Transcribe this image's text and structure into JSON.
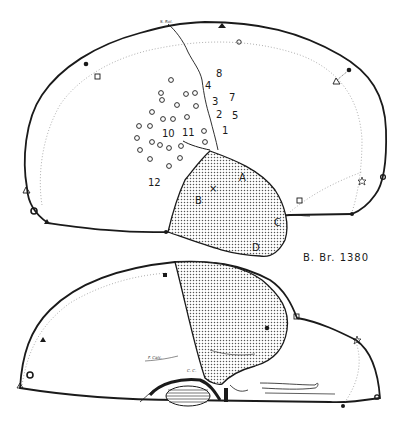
{
  "figure": {
    "specimen_label": "B. Br. 1380",
    "colors": {
      "ink": "#1a1a1a",
      "dotted_line": "#9a9a9a",
      "stipple_fill": "#d6d6d6",
      "background": "#ffffff"
    },
    "lateral_view": {
      "sulcus_label": "S. Rol.",
      "numbers": [
        {
          "id": "n8",
          "text": "8"
        },
        {
          "id": "n4",
          "text": "4"
        },
        {
          "id": "n7",
          "text": "7"
        },
        {
          "id": "n3",
          "text": "3"
        },
        {
          "id": "n2",
          "text": "2"
        },
        {
          "id": "n5",
          "text": "5"
        },
        {
          "id": "n1",
          "text": "1"
        },
        {
          "id": "n10",
          "text": "10"
        },
        {
          "id": "n11",
          "text": "11"
        },
        {
          "id": "n12",
          "text": "12"
        }
      ],
      "lesion_letters": [
        {
          "id": "A",
          "text": "A"
        },
        {
          "id": "B",
          "text": "B"
        },
        {
          "id": "C",
          "text": "C"
        },
        {
          "id": "D",
          "text": "D"
        }
      ],
      "cross_marker": "×",
      "stimulation_points_count": 28
    },
    "medial_view": {
      "calcarine_label": "F. Calc.",
      "callosal_label": "C. C."
    },
    "caption_bottom": ""
  }
}
